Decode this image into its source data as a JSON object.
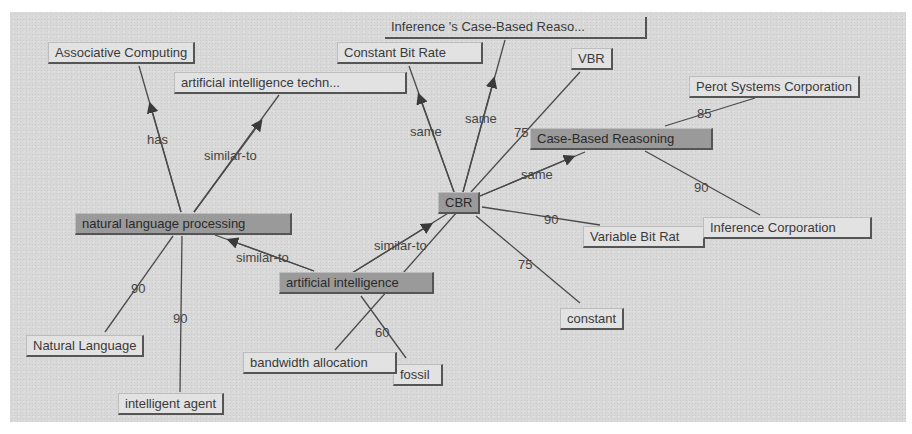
{
  "diagram": {
    "type": "concept-map",
    "nodes": [
      {
        "id": "associative-computing",
        "label": "Associative Computing",
        "highlighted": false
      },
      {
        "id": "ai-techn",
        "label": "artificial intelligence techn...",
        "highlighted": false
      },
      {
        "id": "constant-bit-rate",
        "label": "Constant Bit Rate",
        "highlighted": false
      },
      {
        "id": "inference-cbr",
        "label": "Inference 's Case-Based Reaso...",
        "highlighted": false
      },
      {
        "id": "vbr",
        "label": "VBR",
        "highlighted": false
      },
      {
        "id": "perot",
        "label": "Perot Systems Corporation",
        "highlighted": false
      },
      {
        "id": "case-based-reasoning",
        "label": "Case-Based Reasoning",
        "highlighted": true
      },
      {
        "id": "cbr",
        "label": "CBR",
        "highlighted": true
      },
      {
        "id": "nlp",
        "label": "natural language processing",
        "highlighted": true
      },
      {
        "id": "variable-bit-rate",
        "label": "Variable Bit Rat",
        "highlighted": false
      },
      {
        "id": "inference-corp",
        "label": "Inference Corporation",
        "highlighted": false
      },
      {
        "id": "ai",
        "label": "artificial intelligence",
        "highlighted": true
      },
      {
        "id": "constant",
        "label": "constant",
        "highlighted": false
      },
      {
        "id": "natural-language",
        "label": "Natural Language",
        "highlighted": false
      },
      {
        "id": "bandwidth-allocation",
        "label": "bandwidth allocation",
        "highlighted": false
      },
      {
        "id": "fossil",
        "label": "fossil",
        "highlighted": false
      },
      {
        "id": "intelligent-agent",
        "label": "intelligent agent",
        "highlighted": false
      }
    ],
    "edges": [
      {
        "from": "nlp",
        "to": "associative-computing",
        "label": "has",
        "directed": true
      },
      {
        "from": "nlp",
        "to": "ai-techn",
        "label": "similar-to",
        "directed": true
      },
      {
        "from": "cbr",
        "to": "constant-bit-rate",
        "label": "same",
        "directed": true
      },
      {
        "from": "cbr",
        "to": "inference-cbr",
        "label": "same",
        "directed": true
      },
      {
        "from": "cbr",
        "to": "vbr",
        "label": "75",
        "directed": false
      },
      {
        "from": "cbr",
        "to": "case-based-reasoning",
        "label": "same",
        "directed": true
      },
      {
        "from": "case-based-reasoning",
        "to": "perot",
        "label": "85",
        "directed": false
      },
      {
        "from": "case-based-reasoning",
        "to": "inference-corp",
        "label": "90",
        "directed": false
      },
      {
        "from": "cbr",
        "to": "variable-bit-rate",
        "label": "90",
        "directed": false
      },
      {
        "from": "cbr",
        "to": "constant",
        "label": "75",
        "directed": false
      },
      {
        "from": "ai",
        "to": "cbr",
        "label": "similar-to",
        "directed": true
      },
      {
        "from": "ai",
        "to": "nlp",
        "label": "similar-to",
        "directed": true
      },
      {
        "from": "nlp",
        "to": "natural-language",
        "label": "90",
        "directed": false
      },
      {
        "from": "nlp",
        "to": "intelligent-agent",
        "label": "90",
        "directed": false
      },
      {
        "from": "ai",
        "to": "fossil",
        "label": "60",
        "directed": false
      },
      {
        "from": "cbr",
        "to": "bandwidth-allocation",
        "label": "",
        "directed": false
      }
    ]
  },
  "colors": {
    "background": "#d8d8d8",
    "node_fill": "#e2e2e2",
    "node_highlight_fill": "#9a9a9a",
    "edge": "#4a4a4a",
    "text": "#3a3a3a"
  }
}
